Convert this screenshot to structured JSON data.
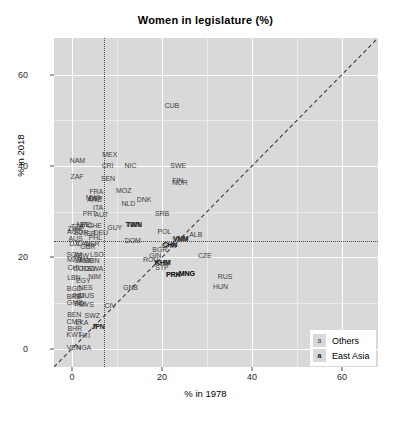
{
  "chart_data": {
    "type": "scatter",
    "title": "Women in legislature (%)",
    "xlabel": "% in 1978",
    "ylabel": "% in 2018",
    "xlim": [
      -4,
      68
    ],
    "ylim": [
      -4,
      68
    ],
    "xticks": [
      0,
      20,
      40,
      60
    ],
    "yticks": [
      0,
      20,
      40,
      60
    ],
    "grid": true,
    "legend_position": "bottom-right",
    "point_marker": "text-label",
    "annotations": {
      "identity_line": {
        "label": "y = x",
        "style": "dashed",
        "from": [
          -4,
          -4
        ],
        "to": [
          68,
          68
        ]
      },
      "vertical_reference": {
        "value": 7.0,
        "style": "dotted"
      },
      "horizontal_reference": {
        "value": 23.5,
        "style": "dotted"
      }
    },
    "series": [
      {
        "name": "Others",
        "points": [
          {
            "label": "CUB",
            "x": 22.2,
            "y": 53.4
          },
          {
            "label": "MEX",
            "x": 8.4,
            "y": 42.6
          },
          {
            "label": "NAM",
            "x": 1.2,
            "y": 41.3
          },
          {
            "label": "CRI",
            "x": 7.9,
            "y": 40.2
          },
          {
            "label": "NIC",
            "x": 13.0,
            "y": 40.2
          },
          {
            "label": "SWE",
            "x": 23.6,
            "y": 40.3
          },
          {
            "label": "ZAF",
            "x": 1.1,
            "y": 37.9
          },
          {
            "label": "SEN",
            "x": 8.0,
            "y": 37.4
          },
          {
            "label": "FIN",
            "x": 23.5,
            "y": 37.0
          },
          {
            "label": "NOR",
            "x": 24.0,
            "y": 36.5
          },
          {
            "label": "FRA",
            "x": 5.4,
            "y": 34.6
          },
          {
            "label": "MOZ",
            "x": 11.5,
            "y": 34.8
          },
          {
            "label": "MWI",
            "x": 4.6,
            "y": 33.3
          },
          {
            "label": "ESP",
            "x": 5.2,
            "y": 33.0
          },
          {
            "label": "ARG",
            "x": 5.0,
            "y": 32.7
          },
          {
            "label": "NLD",
            "x": 12.5,
            "y": 32.0
          },
          {
            "label": "DNK",
            "x": 16.0,
            "y": 32.8
          },
          {
            "label": "ITA",
            "x": 5.8,
            "y": 31.0
          },
          {
            "label": "PRT",
            "x": 3.9,
            "y": 29.6
          },
          {
            "label": "AUT",
            "x": 6.5,
            "y": 29.5
          },
          {
            "label": "SRB",
            "x": 20.0,
            "y": 29.8
          },
          {
            "label": "NPL",
            "x": 2.5,
            "y": 27.4
          },
          {
            "label": "BEL",
            "x": 3.4,
            "y": 27.2
          },
          {
            "label": "CHE",
            "x": 5.0,
            "y": 27.0
          },
          {
            "label": "TWN",
            "x": 13.5,
            "y": 27.3
          },
          {
            "label": "GUY",
            "x": 9.5,
            "y": 26.7
          },
          {
            "label": "ZWE",
            "x": 0.7,
            "y": 26.5
          },
          {
            "label": "TZA",
            "x": 1.2,
            "y": 26.8
          },
          {
            "label": "AGO",
            "x": 0.6,
            "y": 25.7
          },
          {
            "label": "SUR",
            "x": 2.0,
            "y": 25.6
          },
          {
            "label": "ISR",
            "x": 4.0,
            "y": 25.4
          },
          {
            "label": "DEU",
            "x": 6.4,
            "y": 25.6
          },
          {
            "label": "POL",
            "x": 20.5,
            "y": 25.8
          },
          {
            "label": "ALB",
            "x": 27.5,
            "y": 25.0
          },
          {
            "label": "AUS",
            "x": 0.8,
            "y": 24.3
          },
          {
            "label": "PHL",
            "x": 5.2,
            "y": 24.4
          },
          {
            "label": "DOM",
            "x": 13.5,
            "y": 23.8
          },
          {
            "label": "DJI",
            "x": 0.5,
            "y": 23.1
          },
          {
            "label": "CAN",
            "x": 2.5,
            "y": 23.2
          },
          {
            "label": "USR",
            "x": 4.5,
            "y": 23.1
          },
          {
            "label": "VNM",
            "x": 24.0,
            "y": 24.0
          },
          {
            "label": "GBR",
            "x": 3.5,
            "y": 22.5
          },
          {
            "label": "CHN",
            "x": 21.5,
            "y": 22.6
          },
          {
            "label": "BGR",
            "x": 19.5,
            "y": 21.8
          },
          {
            "label": "SOM",
            "x": 0.5,
            "y": 20.8
          },
          {
            "label": "ABW",
            "x": 2.0,
            "y": 20.6
          },
          {
            "label": "LSO",
            "x": 5.5,
            "y": 20.7
          },
          {
            "label": "GIN",
            "x": 18.5,
            "y": 20.6
          },
          {
            "label": "CZE",
            "x": 29.5,
            "y": 20.6
          },
          {
            "label": "MAR",
            "x": 0.6,
            "y": 19.6
          },
          {
            "label": "JAM",
            "x": 2.2,
            "y": 19.5
          },
          {
            "label": "PER",
            "x": 3.2,
            "y": 19.4
          },
          {
            "label": "IDN",
            "x": 4.8,
            "y": 19.4
          },
          {
            "label": "ROU",
            "x": 17.5,
            "y": 19.6
          },
          {
            "label": "KHM",
            "x": 20.0,
            "y": 19.0
          },
          {
            "label": "CHL",
            "x": 0.5,
            "y": 17.8
          },
          {
            "label": "COD",
            "x": 2.0,
            "y": 17.6
          },
          {
            "label": "TGO",
            "x": 3.5,
            "y": 17.6
          },
          {
            "label": "SWA",
            "x": 5.2,
            "y": 17.6
          },
          {
            "label": "STP",
            "x": 20.0,
            "y": 17.8
          },
          {
            "label": "PRK",
            "x": 22.5,
            "y": 16.4
          },
          {
            "label": "MNG",
            "x": 25.5,
            "y": 16.6
          },
          {
            "label": "RUS",
            "x": 34.0,
            "y": 16.0
          },
          {
            "label": "LBN",
            "x": 0.4,
            "y": 15.7
          },
          {
            "label": "EGY",
            "x": 2.5,
            "y": 15.0
          },
          {
            "label": "NIM",
            "x": 5.0,
            "y": 16.0
          },
          {
            "label": "HUN",
            "x": 33.0,
            "y": 13.8
          },
          {
            "label": "BGD",
            "x": 0.5,
            "y": 13.2
          },
          {
            "label": "NES",
            "x": 3.0,
            "y": 13.6
          },
          {
            "label": "GNB",
            "x": 13.0,
            "y": 13.4
          },
          {
            "label": "BRB",
            "x": 0.4,
            "y": 11.6
          },
          {
            "label": "IND",
            "x": 1.4,
            "y": 11.8
          },
          {
            "label": "MUS",
            "x": 3.2,
            "y": 11.8
          },
          {
            "label": "GMB",
            "x": 0.6,
            "y": 10.2
          },
          {
            "label": "BOL",
            "x": 2.0,
            "y": 10.0
          },
          {
            "label": "MYS",
            "x": 3.2,
            "y": 9.8
          },
          {
            "label": "BEN",
            "x": 0.5,
            "y": 7.6
          },
          {
            "label": "CIV",
            "x": 8.5,
            "y": 9.6
          },
          {
            "label": "SWZ",
            "x": 4.5,
            "y": 7.4
          },
          {
            "label": "CMR",
            "x": 0.5,
            "y": 6.0
          },
          {
            "label": "LKA",
            "x": 2.2,
            "y": 5.8
          },
          {
            "label": "BHR",
            "x": 0.6,
            "y": 4.6
          },
          {
            "label": "KWT",
            "x": 0.5,
            "y": 3.2
          },
          {
            "label": "HTI",
            "x": 2.8,
            "y": 3.0
          },
          {
            "label": "VEN",
            "x": 0.4,
            "y": 0.4
          },
          {
            "label": "NGA",
            "x": 2.6,
            "y": 0.3
          }
        ]
      },
      {
        "name": "East Asia",
        "points": [
          {
            "label": "CHN",
            "x": 21.8,
            "y": 22.9
          },
          {
            "label": "TWN",
            "x": 13.8,
            "y": 27.3
          },
          {
            "label": "VNM",
            "x": 24.2,
            "y": 24.2
          },
          {
            "label": "KHM",
            "x": 20.2,
            "y": 19.0
          },
          {
            "label": "MNG",
            "x": 25.5,
            "y": 16.6
          },
          {
            "label": "PRK",
            "x": 22.5,
            "y": 16.4
          },
          {
            "label": "JPN",
            "x": 5.8,
            "y": 5.0
          }
        ]
      }
    ]
  },
  "legend": {
    "key_glyph": "a",
    "entries": [
      {
        "label": "Others"
      },
      {
        "label": "East Asia"
      }
    ]
  },
  "axes": {
    "x": {
      "label": "% in 1978",
      "ticks": [
        "0",
        "20",
        "40",
        "60"
      ]
    },
    "y": {
      "label": "% in 2018",
      "ticks": [
        "0",
        "20",
        "40",
        "60"
      ]
    }
  }
}
